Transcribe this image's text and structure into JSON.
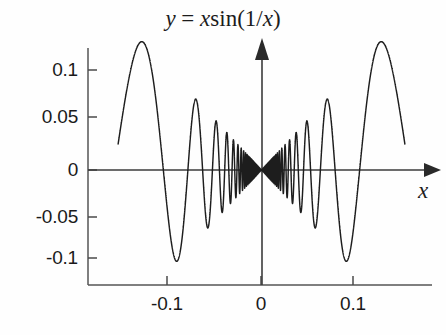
{
  "figure": {
    "title_parts": {
      "y": "y",
      "equals": " = ",
      "x": "x",
      "sin": "sin",
      "open": "(1/",
      "xarg": "x",
      "close": ")"
    },
    "title_text": "y = x sin(1/x)",
    "background_color": "#fefefe",
    "curve_color": "#1d1d1d",
    "axis_color": "#3b3b3b"
  },
  "axes": {
    "x_axis_name": "x",
    "y_axis_name": "",
    "x_ticks": [
      "-0.1",
      "0",
      "0.1"
    ],
    "y_ticks": [
      "0.1",
      "0.05",
      "0",
      "-0.05",
      "-0.1"
    ]
  },
  "chart_data": {
    "type": "line",
    "xlabel": "x",
    "ylabel": "",
    "function": "y = x * sin(1/x)",
    "xlim": [
      -0.155,
      0.155
    ],
    "ylim": [
      -0.13,
      0.135
    ],
    "xticks": [
      -0.1,
      0,
      0.1
    ],
    "xtick_labels": [
      "-0.1",
      "0",
      "0.1"
    ],
    "yticks": [
      0.1,
      0.05,
      0,
      -0.05,
      -0.1
    ],
    "ytick_labels": [
      "0.1",
      "0.05",
      "0",
      "-0.05",
      "-0.1"
    ],
    "grid": false,
    "legend": null,
    "series": [
      {
        "name": "x sin(1/x)",
        "color": "#1d1d1d",
        "x_min": -0.155,
        "x_max": 0.155,
        "samples": 24000,
        "envelope": "|x|",
        "notable_extrema": [
          {
            "x": -0.128,
            "y": 0.128,
            "kind": "max"
          },
          {
            "x": -0.0935,
            "y": -0.0925,
            "kind": "min"
          },
          {
            "x": -0.0715,
            "y": 0.0705,
            "kind": "max"
          },
          {
            "x": -0.0585,
            "y": -0.0575,
            "kind": "min"
          },
          {
            "x": -0.0495,
            "y": 0.0485,
            "kind": "max"
          },
          {
            "x": 0.0495,
            "y": 0.0485,
            "kind": "max"
          },
          {
            "x": 0.0585,
            "y": -0.0575,
            "kind": "min"
          },
          {
            "x": 0.0715,
            "y": 0.0705,
            "kind": "max"
          },
          {
            "x": 0.0935,
            "y": -0.0925,
            "kind": "min"
          },
          {
            "x": 0.128,
            "y": 0.128,
            "kind": "max"
          }
        ],
        "endpoint_left": {
          "x": -0.155,
          "y": 0.0255
        },
        "endpoint_right": {
          "x": 0.155,
          "y": 0.0255
        }
      }
    ]
  }
}
